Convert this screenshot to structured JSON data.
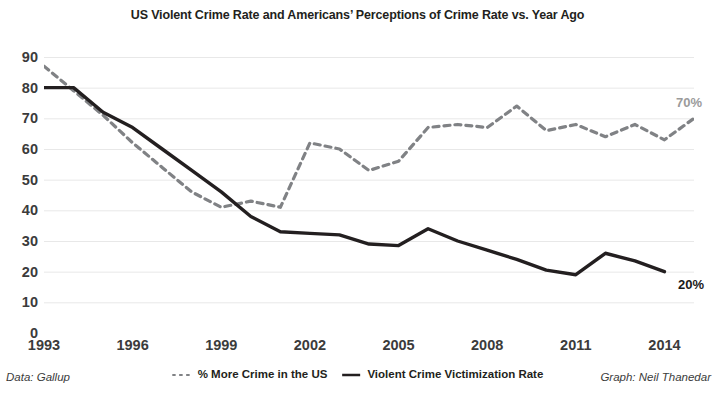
{
  "chart_data": {
    "type": "line",
    "title": "US Violent Crime Rate and Americans’ Perceptions of Crime Rate vs. Year Ago",
    "xlabel": "",
    "ylabel": "",
    "xlim": [
      1993,
      2015
    ],
    "ylim": [
      0,
      90
    ],
    "grid": true,
    "grid_axis": "y",
    "legend_position": "bottom-center",
    "x_ticks": [
      "1993",
      "1996",
      "1999",
      "2002",
      "2005",
      "2008",
      "2011",
      "2014"
    ],
    "x_tick_values": [
      1993,
      1996,
      1999,
      2002,
      2005,
      2008,
      2011,
      2014
    ],
    "y_ticks": [
      "0",
      "10",
      "20",
      "30",
      "40",
      "50",
      "60",
      "70",
      "80",
      "90"
    ],
    "y_tick_values": [
      0,
      10,
      20,
      30,
      40,
      50,
      60,
      70,
      80,
      90
    ],
    "series": [
      {
        "name": "% More Crime in the US",
        "style": "dashed",
        "color": "#808285",
        "x": [
          1993,
          1994,
          1995,
          1996,
          1997,
          1998,
          1999,
          2000,
          2001,
          2002,
          2003,
          2004,
          2005,
          2006,
          2007,
          2008,
          2009,
          2010,
          2011,
          2012,
          2013,
          2014,
          2015
        ],
        "values": [
          87,
          79,
          71,
          62,
          54,
          46,
          41,
          43,
          41,
          62,
          60,
          53,
          56,
          67,
          68,
          67,
          74,
          66,
          68,
          64,
          68,
          63,
          70
        ],
        "end_label": "70%"
      },
      {
        "name": "Violent Crime Victimization Rate",
        "style": "solid",
        "color": "#231f20",
        "x": [
          1993,
          1994,
          1995,
          1996,
          1997,
          1998,
          1999,
          2000,
          2001,
          2002,
          2003,
          2004,
          2005,
          2006,
          2007,
          2008,
          2009,
          2010,
          2011,
          2012,
          2013,
          2014
        ],
        "values": [
          80,
          80,
          72,
          67,
          60,
          53,
          46,
          38,
          33,
          32.5,
          32,
          29,
          28.5,
          34,
          30,
          27,
          24,
          20.5,
          19,
          26,
          23.5,
          20
        ],
        "end_label": "20%"
      }
    ]
  },
  "annotations": {
    "perception_end": "70%",
    "victimization_end": "20%"
  },
  "legend": {
    "items": [
      {
        "label": "% More Crime in the US",
        "marker": "dashed-line-icon"
      },
      {
        "label": "Violent Crime Victimization Rate",
        "marker": "solid-line-icon"
      }
    ]
  },
  "footer": {
    "data_source": "Data: Gallup",
    "credit": "Graph: Neil Thanedar"
  },
  "colors": {
    "solid_line": "#231f20",
    "dashed_line": "#808285",
    "gridline": "#e8e8e8",
    "axis_text": "#3b3b3b",
    "annotation_gray": "#9b9b9b"
  }
}
